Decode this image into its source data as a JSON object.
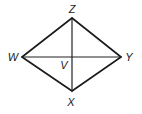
{
  "diagram": {
    "type": "rhombus-with-diagonals",
    "vertices": {
      "Z": {
        "label": "Z",
        "x": 72,
        "y": 18,
        "label_x": 72,
        "label_y": 13
      },
      "Y": {
        "label": "Y",
        "x": 121,
        "y": 57,
        "label_x": 129,
        "label_y": 61
      },
      "X": {
        "label": "X",
        "x": 72,
        "y": 91,
        "label_x": 71,
        "label_y": 106
      },
      "W": {
        "label": "W",
        "x": 22,
        "y": 57,
        "label_x": 13,
        "label_y": 61
      }
    },
    "intersection": {
      "label": "V",
      "x": 72,
      "y": 57,
      "label_x": 64,
      "label_y": 69
    },
    "edges": [
      [
        "W",
        "Z"
      ],
      [
        "Z",
        "Y"
      ],
      [
        "Y",
        "X"
      ],
      [
        "X",
        "W"
      ]
    ],
    "diagonals": [
      [
        "Z",
        "X"
      ],
      [
        "W",
        "Y"
      ]
    ],
    "colors": {
      "stroke": "#1a1a1a",
      "label": "#222222",
      "background": "#ffffff"
    }
  }
}
